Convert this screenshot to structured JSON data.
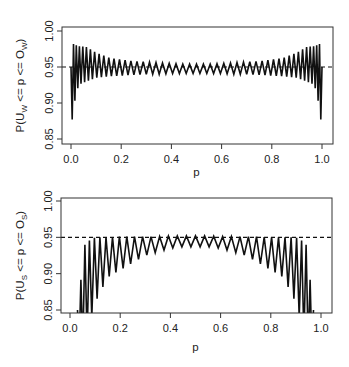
{
  "chart_data": [
    {
      "type": "line",
      "title": "",
      "xlabel": "p",
      "ylabel": "P(U_W <= p <= O_W)",
      "ylabel_parts": {
        "pre": "P(U",
        "sub1": "W",
        "mid": " <= p <= O",
        "sub2": "W",
        "post": ")"
      },
      "xlim": [
        0.0,
        1.0
      ],
      "ylim": [
        0.85,
        1.0
      ],
      "xticks": [
        "0.0",
        "0.2",
        "0.4",
        "0.6",
        "0.8",
        "1.0"
      ],
      "yticks": [
        "0.85",
        "0.90",
        "0.95",
        "1.00"
      ],
      "grid": false,
      "reference_line": {
        "y": 0.95,
        "style": "dashed"
      },
      "series": [
        {
          "name": "coverage (Wilson)",
          "oscillation_cycles": 48,
          "envelope": {
            "x": [
              0.0,
              0.01,
              0.03,
              0.06,
              0.1,
              0.15,
              0.2,
              0.25,
              0.3,
              0.35,
              0.4,
              0.45,
              0.5,
              0.55,
              0.6,
              0.65,
              0.7,
              0.75,
              0.8,
              0.85,
              0.9,
              0.94,
              0.97,
              0.99,
              1.0
            ],
            "upper": [
              0.95,
              0.982,
              0.979,
              0.978,
              0.97,
              0.963,
              0.96,
              0.958,
              0.957,
              0.956,
              0.955,
              0.954,
              0.954,
              0.954,
              0.955,
              0.956,
              0.957,
              0.958,
              0.96,
              0.963,
              0.97,
              0.978,
              0.979,
              0.982,
              0.95
            ],
            "lower": [
              0.86,
              0.895,
              0.925,
              0.93,
              0.935,
              0.937,
              0.938,
              0.939,
              0.94,
              0.94,
              0.941,
              0.941,
              0.941,
              0.941,
              0.941,
              0.94,
              0.94,
              0.939,
              0.938,
              0.937,
              0.935,
              0.93,
              0.925,
              0.895,
              0.86
            ]
          }
        }
      ]
    },
    {
      "type": "line",
      "title": "",
      "xlabel": "p",
      "ylabel": "P(U_S <= p <= O_S)",
      "ylabel_parts": {
        "pre": "P(U",
        "sub1": "S",
        "mid": " <= p <= O",
        "sub2": "S",
        "post": ")"
      },
      "xlim": [
        0.0,
        1.0
      ],
      "ylim": [
        0.85,
        1.0
      ],
      "xticks": [
        "0.0",
        "0.2",
        "0.4",
        "0.6",
        "0.8",
        "1.0"
      ],
      "yticks": [
        "0.85",
        "0.90",
        "0.95",
        "1.00"
      ],
      "grid": false,
      "reference_line": {
        "y": 0.95,
        "style": "dashed"
      },
      "series": [
        {
          "name": "coverage (score/other)",
          "oscillation_cycles": 34,
          "envelope": {
            "x": [
              0.03,
              0.06,
              0.1,
              0.15,
              0.2,
              0.25,
              0.3,
              0.35,
              0.4,
              0.45,
              0.5,
              0.55,
              0.6,
              0.65,
              0.7,
              0.75,
              0.8,
              0.85,
              0.9,
              0.94,
              0.97
            ],
            "upper": [
              0.85,
              0.942,
              0.95,
              0.95,
              0.951,
              0.951,
              0.951,
              0.951,
              0.952,
              0.952,
              0.952,
              0.952,
              0.951,
              0.951,
              0.951,
              0.951,
              0.95,
              0.95,
              0.95,
              0.942,
              0.85
            ],
            "lower": [
              0.8,
              0.8,
              0.86,
              0.895,
              0.905,
              0.915,
              0.925,
              0.93,
              0.935,
              0.937,
              0.937,
              0.937,
              0.935,
              0.93,
              0.925,
              0.915,
              0.905,
              0.895,
              0.86,
              0.8,
              0.8
            ]
          }
        }
      ]
    }
  ],
  "plots": [
    {
      "box": {
        "left": 62,
        "top": 27,
        "right": 333,
        "bottom": 144
      },
      "x0px": 71,
      "x1px": 322,
      "y_at_100": 31,
      "y_at_085": 139,
      "xlabel_y": 176,
      "ylabel_x": 24
    },
    {
      "box": {
        "left": 61,
        "top": 198,
        "right": 332,
        "bottom": 313
      },
      "x0px": 70,
      "x1px": 321,
      "y_at_100": 201,
      "y_at_085": 310,
      "xlabel_y": 351,
      "ylabel_x": 24
    }
  ]
}
